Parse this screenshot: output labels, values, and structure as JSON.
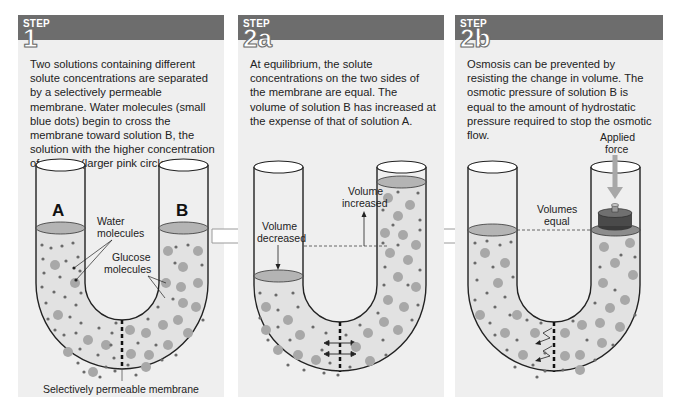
{
  "steps": [
    {
      "step_word": "STEP",
      "step_number": "1",
      "description": "Two solutions containing different solute concentrations are separated by a selectively permeable membrane. Water molecules (small blue dots) begin to cross the membrane toward solution B, the solution with the higher concentration of solutes (larger pink circles).",
      "labels": {
        "tube_a": "A",
        "tube_b": "B",
        "water_1": "Water",
        "water_2": "molecules",
        "glucose_1": "Glucose",
        "glucose_2": "molecules",
        "membrane": "Selectively permeable membrane"
      }
    },
    {
      "step_word": "STEP",
      "step_number": "2a",
      "description": "At equilibrium, the solute concentrations on the two sides of the membrane are equal. The volume of solution B has increased at the expense of that of solution A.",
      "labels": {
        "decreased_1": "Volume",
        "decreased_2": "decreased",
        "increased_1": "Volume",
        "increased_2": "increased"
      }
    },
    {
      "step_word": "STEP",
      "step_number": "2b",
      "description": "Osmosis can be prevented by resisting the change in volume. The osmotic pressure of solution B is equal to the amount of hydrostatic pressure required to stop the osmotic flow.",
      "labels": {
        "force_1": "Applied",
        "force_2": "force",
        "equal_1": "Volumes",
        "equal_2": "equal"
      }
    }
  ],
  "colors": {
    "panel_bg": "#efefef",
    "header_bg": "#6d6d6d",
    "liquid": "#e2e2e2",
    "surface": "#b4b4b4",
    "solute": "#a8a8a8",
    "water": "#6a6a6a",
    "outline": "#222222"
  }
}
